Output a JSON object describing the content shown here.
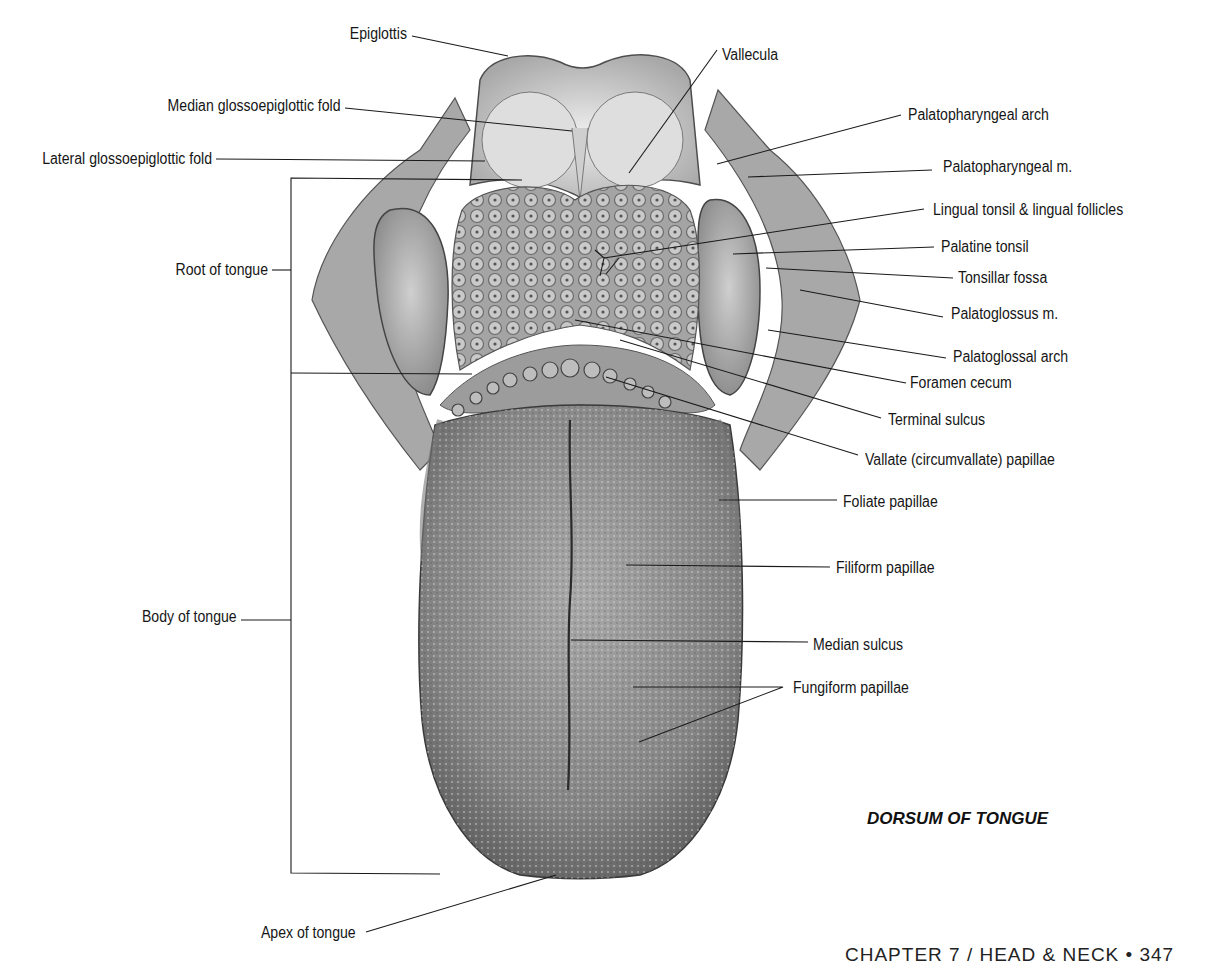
{
  "figure": {
    "title": "DORSUM OF TONGUE",
    "footer": "CHAPTER 7 / HEAD & NECK • 347",
    "colors": {
      "background": "#ffffff",
      "ink": "#151515",
      "tissue_light": "#d9d9d9",
      "tissue_mid": "#9a9a9a",
      "tissue_dark": "#5e5e5e"
    }
  },
  "labels": {
    "left": [
      {
        "text": "Epiglottis"
      },
      {
        "text": "Median glossoepiglottic fold"
      },
      {
        "text": "Lateral glossoepiglottic fold"
      },
      {
        "text": "Root of tongue"
      },
      {
        "text": "Body of tongue"
      },
      {
        "text": "Apex of tongue"
      }
    ],
    "right": [
      {
        "text": "Vallecula"
      },
      {
        "text": "Palatopharyngeal arch"
      },
      {
        "text": "Palatopharyngeal m."
      },
      {
        "text": "Lingual tonsil & lingual follicles"
      },
      {
        "text": "Palatine tonsil"
      },
      {
        "text": "Tonsillar fossa"
      },
      {
        "text": "Palatoglossus m."
      },
      {
        "text": "Palatoglossal arch"
      },
      {
        "text": "Foramen cecum"
      },
      {
        "text": "Terminal sulcus"
      },
      {
        "text": "Vallate (circumvallate) papillae"
      },
      {
        "text": "Foliate papillae"
      },
      {
        "text": "Filiform papillae"
      },
      {
        "text": "Median sulcus"
      },
      {
        "text": "Fungiform papillae"
      }
    ]
  }
}
